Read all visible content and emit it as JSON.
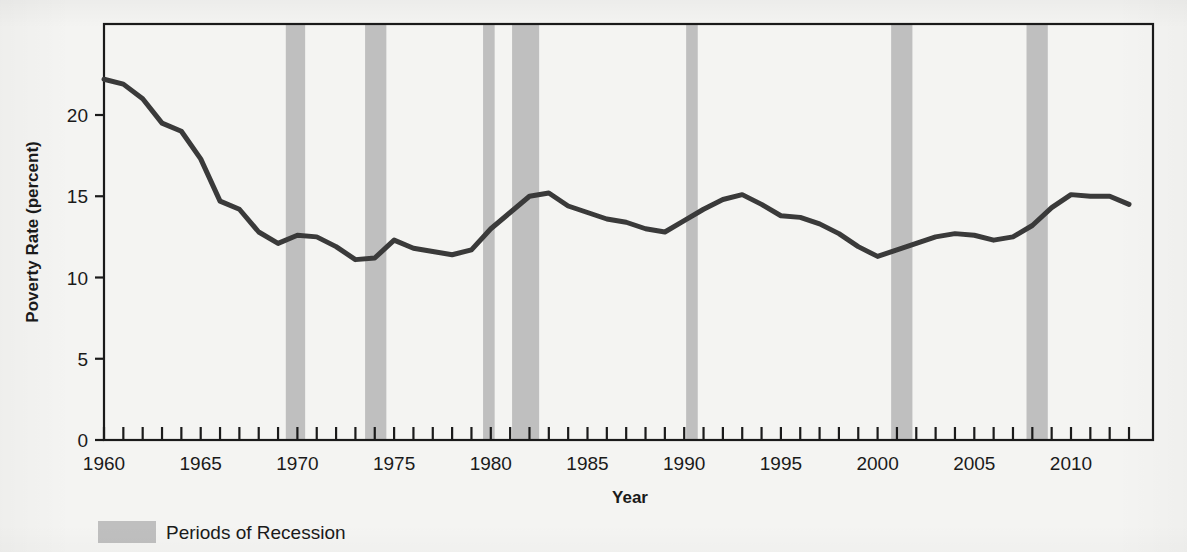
{
  "chart_data": {
    "type": "line",
    "title": "",
    "xlabel": "Year",
    "ylabel": "Poverty Rate (percent)",
    "xlim": [
      1960,
      2013
    ],
    "ylim": [
      0,
      25.6
    ],
    "yticks": [
      0,
      5,
      10,
      15,
      20
    ],
    "ytick_labels": [
      "0",
      "5",
      "10",
      "15",
      "20"
    ],
    "xticks": [
      1960,
      1965,
      1970,
      1975,
      1980,
      1985,
      1990,
      1995,
      2000,
      2005,
      2010
    ],
    "xtick_labels": [
      "1960",
      "1965",
      "1970",
      "1975",
      "1980",
      "1985",
      "1990",
      "1995",
      "2000",
      "2005",
      "2010"
    ],
    "minor_xtick_interval": 1,
    "grid": false,
    "legend_position": "below-left",
    "series": [
      {
        "name": "Poverty Rate",
        "color": "#3a3a3a",
        "line_width": 5,
        "x": [
          1960,
          1961,
          1962,
          1963,
          1964,
          1965,
          1966,
          1967,
          1968,
          1969,
          1970,
          1971,
          1972,
          1973,
          1974,
          1975,
          1976,
          1977,
          1978,
          1979,
          1980,
          1981,
          1982,
          1983,
          1984,
          1985,
          1986,
          1987,
          1988,
          1989,
          1990,
          1991,
          1992,
          1993,
          1994,
          1995,
          1996,
          1997,
          1998,
          1999,
          2000,
          2001,
          2002,
          2003,
          2004,
          2005,
          2006,
          2007,
          2008,
          2009,
          2010,
          2011,
          2012,
          2013
        ],
        "values": [
          22.2,
          21.9,
          21.0,
          19.5,
          19.0,
          17.3,
          14.7,
          14.2,
          12.8,
          12.1,
          12.6,
          12.5,
          11.9,
          11.1,
          11.2,
          12.3,
          11.8,
          11.6,
          11.4,
          11.7,
          13.0,
          14.0,
          15.0,
          15.2,
          14.4,
          14.0,
          13.6,
          13.4,
          13.0,
          12.8,
          13.5,
          14.2,
          14.8,
          15.1,
          14.5,
          13.8,
          13.7,
          13.3,
          12.7,
          11.9,
          11.3,
          11.7,
          12.1,
          12.5,
          12.7,
          12.6,
          12.3,
          12.5,
          13.2,
          14.3,
          15.1,
          15.0,
          15.0,
          14.5
        ]
      }
    ],
    "recession_bands": [
      {
        "label": "1969-1970",
        "start": 1969.4,
        "end": 1970.4
      },
      {
        "label": "1973-1975",
        "start": 1973.5,
        "end": 1974.6
      },
      {
        "label": "1980",
        "start": 1979.6,
        "end": 1980.2
      },
      {
        "label": "1981-1982",
        "start": 1981.1,
        "end": 1982.5
      },
      {
        "label": "1990-1991",
        "start": 1990.1,
        "end": 1990.7
      },
      {
        "label": "2001",
        "start": 2000.7,
        "end": 2001.8
      },
      {
        "label": "2007-2009",
        "start": 2007.7,
        "end": 2008.8
      }
    ],
    "recession_band_color": "#bfbfbf"
  },
  "legend": {
    "items": [
      {
        "label": "Periods of Recession",
        "color": "#bfbfbf"
      }
    ]
  },
  "colors": {
    "line": "#3a3a3a",
    "recession": "#bfbfbf",
    "axis": "#1a1a1a",
    "background": "#f4f4f2"
  }
}
